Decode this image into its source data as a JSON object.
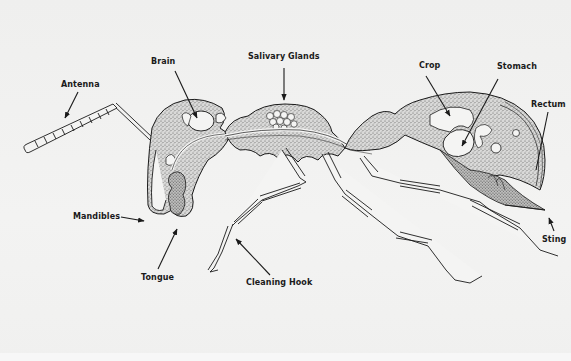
{
  "diagram": {
    "colors": {
      "background": "#f1f1f0",
      "ink": "#1a1a1a",
      "stipple": "#6a6a6a"
    },
    "labels": [
      {
        "id": "antenna",
        "text": "Antenna"
      },
      {
        "id": "brain",
        "text": "Brain"
      },
      {
        "id": "salivary-glands",
        "text": "Salivary Glands"
      },
      {
        "id": "crop",
        "text": "Crop"
      },
      {
        "id": "stomach",
        "text": "Stomach"
      },
      {
        "id": "rectum",
        "text": "Rectum"
      },
      {
        "id": "mandibles",
        "text": "Mandibles"
      },
      {
        "id": "tongue",
        "text": "Tongue"
      },
      {
        "id": "cleaning-hook",
        "text": "Cleaning Hook"
      },
      {
        "id": "sting",
        "text": "Sting"
      }
    ]
  }
}
